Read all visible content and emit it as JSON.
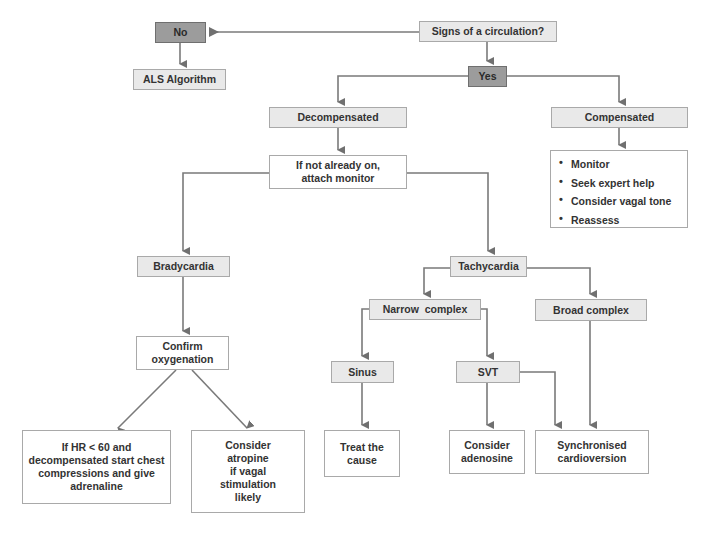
{
  "diagram": {
    "colors": {
      "decision_fill": "#9c9c9c",
      "box_fill": "#e9e9e9",
      "action_fill": "#ffffff",
      "border": "#a9a9a9",
      "arrow": "#707070",
      "text": "#333333"
    },
    "nodes": {
      "signs": "Signs of a circulation?",
      "no": "No",
      "als": "ALS Algorithm",
      "yes": "Yes",
      "decompensated": "Decompensated",
      "compensated": "Compensated",
      "compensated_actions": [
        "Monitor",
        "Seek expert help",
        "Consider vagal tone",
        "Reassess"
      ],
      "attach_line1": "If not already on,",
      "attach_line2": "attach monitor",
      "bradycardia": "Bradycardia",
      "tachycardia": "Tachycardia",
      "narrow": "Narrow  complex",
      "broad": "Broad complex",
      "confirm_line1": "Confirm",
      "confirm_line2": "oxygenation",
      "sinus": "Sinus",
      "svt": "SVT",
      "hr_lines": [
        "If HR < 60 and",
        "decompensated start chest",
        "compressions and give",
        "adrenaline"
      ],
      "atropine_lines": [
        "Consider",
        "atropine",
        "if vagal",
        "stimulation",
        "likely"
      ],
      "treat_lines": [
        "Treat the",
        "cause"
      ],
      "adenosine_lines": [
        "Consider",
        "adenosine"
      ],
      "cardioversion_lines": [
        "Synchronised",
        "cardioversion"
      ]
    },
    "edges": [
      {
        "from": "signs",
        "to": "no"
      },
      {
        "from": "no",
        "to": "als"
      },
      {
        "from": "signs",
        "to": "yes"
      },
      {
        "from": "yes",
        "to": "decompensated"
      },
      {
        "from": "yes",
        "to": "compensated"
      },
      {
        "from": "compensated",
        "to": "compensated_actions"
      },
      {
        "from": "decompensated",
        "to": "attach"
      },
      {
        "from": "attach",
        "to": "bradycardia"
      },
      {
        "from": "attach",
        "to": "tachycardia"
      },
      {
        "from": "bradycardia",
        "to": "confirm"
      },
      {
        "from": "confirm",
        "to": "hr"
      },
      {
        "from": "confirm",
        "to": "atropine"
      },
      {
        "from": "tachycardia",
        "to": "narrow"
      },
      {
        "from": "tachycardia",
        "to": "broad"
      },
      {
        "from": "narrow",
        "to": "sinus"
      },
      {
        "from": "narrow",
        "to": "svt"
      },
      {
        "from": "sinus",
        "to": "treat"
      },
      {
        "from": "svt",
        "to": "adenosine"
      },
      {
        "from": "svt",
        "to": "cardioversion"
      },
      {
        "from": "broad",
        "to": "cardioversion"
      }
    ]
  }
}
